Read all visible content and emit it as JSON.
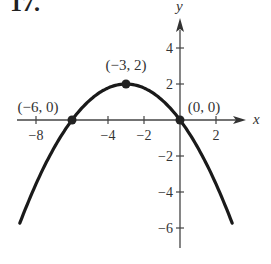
{
  "problem_number": "17.",
  "chart_data": {
    "type": "line",
    "title": "",
    "xlabel": "x",
    "ylabel": "y",
    "function": "y = -(2/9)(x+3)^2 + 2",
    "x_ticks": [
      -8,
      -4,
      -2,
      2
    ],
    "x_tick_labels": [
      "−8",
      "−4",
      "−2",
      "2"
    ],
    "y_ticks": [
      4,
      2,
      -2,
      -4,
      -6
    ],
    "y_tick_labels": [
      "4",
      "2",
      "−2",
      "−4",
      "−6"
    ],
    "xlim": [
      -9,
      4
    ],
    "ylim": [
      -7,
      5.5
    ],
    "grid": false,
    "points": [
      {
        "x": -6,
        "y": 0,
        "label": "(−6, 0)"
      },
      {
        "x": -3,
        "y": 2,
        "label": "(−3, 2)"
      },
      {
        "x": 0,
        "y": 0,
        "label": "(0, 0)"
      }
    ],
    "series": [
      {
        "name": "parabola",
        "x_range": [
          -8.9,
          2.9
        ]
      }
    ]
  }
}
